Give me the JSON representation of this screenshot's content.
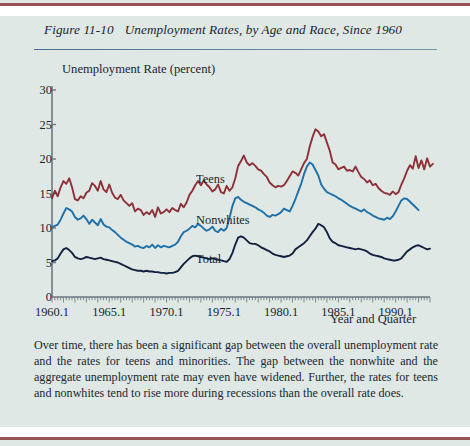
{
  "figure": {
    "number": "Figure 11-10",
    "title": "Unemployment Rates, by Age and Race, Since 1960"
  },
  "caption": "Over time, there has been a significant gap between the overall unemployment rate and the rates for teens and minorities. The gap between the nonwhite and the aggregate unemployment rate may even have widened. Further, the rates for teens and nonwhites tend to rise more during recessions than the overall rate does.",
  "colors": {
    "page_background": "#dfe8e4",
    "teens": "#8e3038",
    "nonwhites": "#1f6fa8",
    "total": "#12203f",
    "axis": "#6b7780",
    "title_rule": "#4a6f92",
    "page_rule": "#9b5158"
  },
  "series_labels": {
    "teens": "Teens",
    "nonwhites": "Nonwhites",
    "total": "Total"
  },
  "chart_data": {
    "type": "line",
    "title": "Unemployment Rates, by Age and Race, Since 1960",
    "xlabel": "Year and Quarter",
    "ylabel": "Unemployment Rate (percent)",
    "ylim": [
      0,
      30
    ],
    "yticks": [
      0,
      5,
      10,
      15,
      20,
      25,
      30
    ],
    "xlim": [
      1960.1,
      1993.1
    ],
    "xticks": [
      1960.1,
      1965.1,
      1970.1,
      1975.1,
      1980.1,
      1985.1,
      1990.1
    ],
    "xtick_labels": [
      "1960.1",
      "1965.1",
      "1970.1",
      "1975.1",
      "1980.1",
      "1985.1",
      "1990.1"
    ],
    "grid": false,
    "legend": "inline-labels",
    "minor_ticks": "quarterly",
    "x_start": 1960.1,
    "x_step_years": 0.25,
    "series": [
      {
        "name": "Teens",
        "color": "#8e3038",
        "values": [
          14.3,
          15.4,
          14.6,
          15.9,
          16.8,
          16.4,
          17.2,
          15.9,
          14.2,
          14.0,
          14.6,
          14.3,
          15.1,
          15.4,
          16.5,
          16.1,
          15.4,
          16.8,
          15.6,
          15.2,
          16.3,
          15.1,
          14.4,
          14.2,
          14.8,
          14.0,
          13.6,
          13.2,
          13.6,
          12.4,
          12.8,
          12.6,
          11.9,
          12.3,
          12.0,
          12.6,
          11.6,
          13.0,
          12.1,
          12.3,
          12.7,
          12.3,
          12.9,
          12.6,
          12.4,
          13.5,
          13.0,
          13.7,
          14.8,
          15.4,
          16.2,
          16.8,
          16.2,
          16.9,
          16.3,
          15.9,
          15.3,
          15.6,
          16.3,
          15.2,
          15.0,
          16.1,
          15.4,
          15.9,
          17.2,
          19.0,
          19.7,
          20.5,
          19.5,
          19.1,
          19.4,
          19.0,
          18.5,
          18.3,
          17.8,
          17.4,
          16.6,
          16.2,
          15.9,
          16.1,
          16.0,
          16.2,
          16.8,
          17.5,
          18.2,
          18.0,
          17.6,
          18.5,
          19.4,
          20.0,
          21.8,
          23.2,
          24.3,
          24.0,
          23.3,
          23.6,
          22.4,
          21.2,
          19.5,
          19.2,
          18.5,
          18.7,
          18.9,
          18.3,
          18.4,
          18.2,
          18.9,
          18.1,
          17.4,
          17.1,
          16.6,
          16.9,
          16.2,
          16.4,
          15.8,
          15.4,
          15.1,
          15.0,
          14.8,
          15.3,
          14.9,
          15.2,
          16.3,
          17.2,
          18.3,
          19.1,
          18.6,
          20.4,
          18.7,
          19.8,
          18.5,
          20.1,
          18.9,
          19.3
        ]
      },
      {
        "name": "Nonwhites",
        "color": "#1f6fa8",
        "values": [
          10.1,
          10.3,
          10.5,
          11.2,
          12.1,
          12.9,
          12.7,
          12.4,
          11.6,
          11.2,
          11.4,
          11.8,
          11.3,
          10.6,
          11.2,
          10.8,
          10.4,
          11.3,
          10.5,
          10.2,
          10.1,
          9.7,
          9.4,
          9.0,
          8.6,
          8.3,
          8.0,
          7.8,
          7.6,
          7.3,
          7.4,
          7.2,
          7.1,
          7.4,
          7.2,
          7.6,
          7.1,
          7.5,
          7.2,
          7.4,
          7.3,
          7.2,
          7.4,
          7.6,
          8.0,
          8.8,
          9.4,
          9.6,
          9.9,
          10.3,
          10.1,
          10.6,
          10.3,
          9.9,
          9.6,
          9.8,
          10.2,
          9.6,
          9.4,
          9.9,
          9.6,
          10.0,
          11.5,
          13.2,
          14.3,
          14.5,
          14.1,
          13.8,
          13.6,
          13.4,
          13.2,
          13.0,
          12.7,
          12.5,
          12.2,
          11.8,
          11.6,
          11.9,
          11.8,
          12.0,
          12.3,
          12.8,
          12.6,
          12.4,
          13.2,
          14.2,
          15.3,
          16.4,
          17.8,
          18.9,
          19.5,
          19.2,
          18.4,
          17.6,
          16.3,
          15.7,
          15.2,
          15.0,
          14.8,
          14.6,
          14.3,
          14.1,
          13.8,
          13.5,
          13.2,
          13.0,
          12.8,
          12.6,
          12.4,
          12.7,
          12.3,
          12.1,
          11.8,
          11.6,
          11.4,
          11.3,
          11.2,
          11.5,
          11.3,
          11.7,
          12.4,
          13.2,
          14.0,
          14.3,
          14.2,
          13.8,
          13.4,
          13.0,
          12.6
        ]
      },
      {
        "name": "Total",
        "color": "#12203f",
        "values": [
          5.2,
          5.3,
          5.6,
          6.3,
          6.9,
          7.1,
          6.8,
          6.4,
          5.8,
          5.6,
          5.5,
          5.6,
          5.8,
          5.7,
          5.6,
          5.5,
          5.6,
          5.7,
          5.5,
          5.4,
          5.3,
          5.2,
          5.1,
          5.0,
          4.8,
          4.6,
          4.4,
          4.2,
          4.0,
          3.9,
          3.8,
          3.8,
          3.7,
          3.8,
          3.7,
          3.7,
          3.6,
          3.6,
          3.5,
          3.5,
          3.4,
          3.5,
          3.5,
          3.6,
          3.8,
          4.3,
          4.8,
          5.2,
          5.6,
          5.9,
          6.0,
          5.9,
          5.8,
          5.7,
          5.6,
          5.5,
          5.6,
          5.5,
          5.4,
          5.3,
          5.2,
          5.1,
          5.5,
          6.4,
          7.6,
          8.6,
          8.8,
          8.6,
          8.2,
          7.8,
          7.7,
          7.7,
          7.5,
          7.2,
          7.0,
          6.8,
          6.6,
          6.3,
          6.1,
          6.0,
          5.9,
          5.8,
          5.9,
          6.0,
          6.3,
          6.9,
          7.2,
          7.5,
          7.8,
          8.2,
          8.8,
          9.4,
          9.9,
          10.6,
          10.4,
          10.1,
          9.4,
          8.5,
          8.0,
          7.8,
          7.5,
          7.4,
          7.3,
          7.2,
          7.1,
          7.0,
          6.9,
          7.0,
          6.9,
          6.8,
          6.6,
          6.3,
          6.1,
          6.0,
          5.9,
          5.8,
          5.6,
          5.5,
          5.4,
          5.3,
          5.3,
          5.4,
          5.6,
          6.1,
          6.6,
          6.9,
          7.2,
          7.4,
          7.5,
          7.3,
          7.1,
          6.9,
          7.0
        ]
      }
    ]
  }
}
